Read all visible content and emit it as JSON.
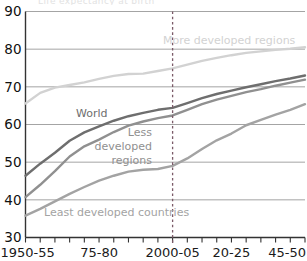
{
  "chart_data": {
    "type": "line",
    "title": "",
    "xlabel": "",
    "ylabel": "",
    "ylim": [
      30,
      90
    ],
    "grid": true,
    "legend_position": "inline-labels",
    "y_ticks": [
      "90",
      "80",
      "70",
      "60",
      "50",
      "40",
      "30"
    ],
    "y_tick_values": [
      90,
      80,
      70,
      60,
      50,
      40,
      30
    ],
    "x_tick_labels": [
      "1950-55",
      "75-80",
      "2000-05",
      "20-25",
      "45-50"
    ],
    "x_tick_label_periods": [
      0,
      5,
      10,
      14,
      19
    ],
    "x": [
      "1950-55",
      "1955-60",
      "1960-65",
      "1965-70",
      "1970-75",
      "1975-80",
      "1980-85",
      "1985-90",
      "1990-95",
      "1995-2000",
      "2000-05",
      "2005-10",
      "2010-15",
      "2015-20",
      "2020-25",
      "2025-30",
      "2030-35",
      "2035-40",
      "2040-45",
      "2045-50"
    ],
    "annotations": [
      {
        "text": "projection-divider",
        "x_category": "2000-05",
        "style": "dashed-vertical"
      }
    ],
    "series": [
      {
        "name": "More developed regions",
        "color": "#d2d2d2",
        "label_text": "More developed regions",
        "values": [
          65.6,
          68.4,
          69.8,
          70.5,
          71.2,
          72.1,
          72.9,
          73.4,
          73.5,
          74.2,
          74.9,
          75.9,
          76.9,
          77.7,
          78.4,
          79.0,
          79.4,
          79.8,
          80.1,
          80.5
        ]
      },
      {
        "name": "World",
        "color": "#6e6e6e",
        "label_text": "World",
        "values": [
          46.4,
          49.6,
          52.5,
          55.7,
          57.9,
          59.5,
          61.0,
          62.2,
          63.1,
          63.9,
          64.4,
          65.7,
          67.0,
          68.1,
          69.0,
          69.9,
          70.7,
          71.5,
          72.2,
          73.0
        ]
      },
      {
        "name": "Less developed regions",
        "color": "#909090",
        "label_text": "Less developed regions",
        "values": [
          40.7,
          44.0,
          47.6,
          51.5,
          54.2,
          56.0,
          58.0,
          59.7,
          60.8,
          61.7,
          62.4,
          63.9,
          65.4,
          66.6,
          67.6,
          68.6,
          69.4,
          70.3,
          71.1,
          71.9
        ]
      },
      {
        "name": "Least developed countries",
        "color": "#a3a3a3",
        "label_text": "Least developed countries",
        "values": [
          35.8,
          37.6,
          39.6,
          41.6,
          43.4,
          45.1,
          46.4,
          47.5,
          48.0,
          48.2,
          49.0,
          51.0,
          53.5,
          55.8,
          57.6,
          59.8,
          61.2,
          62.6,
          63.9,
          65.4
        ]
      }
    ]
  },
  "colors": {
    "axis": "#333333",
    "grid": "#9a9a9a",
    "divider": "#7b5a68",
    "background": "#ffffff",
    "tick_text": "#111111"
  },
  "ghost_title": "Life expectancy at birth"
}
